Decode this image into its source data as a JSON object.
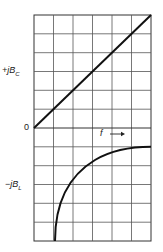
{
  "diagram": {
    "type": "susceptance-vs-frequency",
    "labels": {
      "positive_axis": {
        "prefix": "+jB",
        "sub": "C"
      },
      "zero": "0",
      "negative_axis": {
        "prefix": "−jB",
        "sub": "L"
      },
      "frequency": "f",
      "frequency_arrow": "→"
    },
    "grid": {
      "columns": 6,
      "rows": 12,
      "color": "#555555"
    },
    "curves": [
      {
        "name": "capacitive-susceptance",
        "description": "straight line rising from origin to top-right corner",
        "color": "#111111"
      },
      {
        "name": "inductive-susceptance",
        "description": "curve rising from bottom at first column toward one row below zero at right",
        "color": "#111111"
      }
    ]
  }
}
